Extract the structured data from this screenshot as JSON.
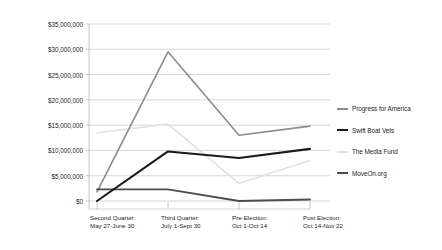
{
  "chart_data": {
    "type": "line",
    "title": "",
    "xlabel": "",
    "ylabel": "",
    "ylim": [
      0,
      35000000
    ],
    "grid": true,
    "legend_position": "right",
    "categories": [
      "Second Quarter: May 27-June 30",
      "Third Quarter: July 1-Sept 30",
      "Pre-Election: Oct 1-Oct 14",
      "Post Election: Oct 14-Nov 22"
    ],
    "category_lines": [
      [
        "Second Quarter:",
        "May 27-June 30"
      ],
      [
        "Third Quarter:",
        "July 1-Sept 30"
      ],
      [
        "Pre-Election:",
        "Oct 1-Oct 14"
      ],
      [
        "Post Election:",
        "Oct 14-Nov 22"
      ]
    ],
    "ytick_labels": [
      "$35,000,000",
      "$30,000,000",
      "$25,000,000",
      "$20,000,000",
      "$15,000,000",
      "$10,000,000",
      "$5,000,000",
      "$0"
    ],
    "ytick_values": [
      35000000,
      30000000,
      25000000,
      20000000,
      15000000,
      10000000,
      5000000,
      0
    ],
    "series": [
      {
        "name": "Progress for America",
        "color": "#8c8c8c",
        "width": 1.6,
        "values": [
          1800000,
          29500000,
          13000000,
          14800000
        ]
      },
      {
        "name": "Swift Boat Vets",
        "color": "#1a1a1a",
        "width": 2.1,
        "values": [
          0,
          9800000,
          8500000,
          10300000
        ]
      },
      {
        "name": "The Media Fund",
        "color": "#e2e2e2",
        "width": 1.7,
        "values": [
          13500000,
          15200000,
          3500000,
          8000000
        ]
      },
      {
        "name": "MoveOn.org",
        "color": "#4d4d4d",
        "width": 1.9,
        "values": [
          2300000,
          2300000,
          0,
          300000
        ]
      }
    ]
  },
  "axis": {
    "line_color": "#bfbfbf",
    "grid_color": "#cccccc"
  }
}
